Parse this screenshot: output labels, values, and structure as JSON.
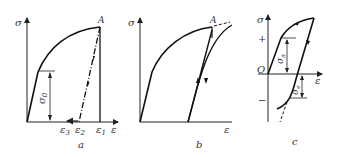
{
  "figure": {
    "panels": [
      {
        "id": "a",
        "caption": "a",
        "y_axis_label": "σ",
        "x_axis_label": "ε",
        "point_label": "A",
        "dimension_label": "σ0",
        "dimension_main": "σ",
        "dimension_sub": "0",
        "strain_labels": [
          {
            "main": "ε",
            "sub": "3"
          },
          {
            "main": "ε",
            "sub": "2"
          },
          {
            "main": "ε",
            "sub": "1"
          }
        ]
      },
      {
        "id": "b",
        "caption": "b",
        "y_axis_label": "σ",
        "x_axis_label": "ε",
        "point_label": "A"
      },
      {
        "id": "c",
        "caption": "c",
        "y_axis_label": "σ",
        "x_axis_label": "ε",
        "origin_label": "O",
        "plus_label": "+",
        "minus_label": "−",
        "dimension_upper_main": "σ",
        "dimension_upper_sub": "a",
        "dimension_lower_main": "σ",
        "dimension_lower_sub": "e"
      }
    ]
  }
}
